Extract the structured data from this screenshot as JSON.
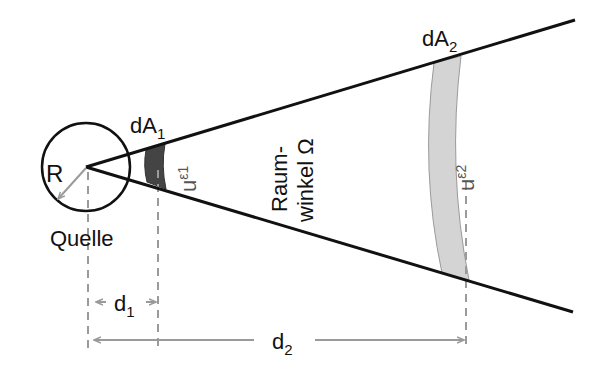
{
  "diagram": {
    "type": "solid-angle-illustration",
    "colors": {
      "line": "#111111",
      "dimension": "#9a9a9a",
      "band_near": "#444444",
      "band_far": "#d4d4d4",
      "band_far_edge": "#9a9a9a",
      "background": "#ffffff"
    },
    "labels": {
      "source_radius": "R",
      "source_name": "Quelle",
      "area_near": {
        "base": "dA",
        "sub": "1"
      },
      "area_far": {
        "base": "dA",
        "sub": "2"
      },
      "energy_near": {
        "base": "u",
        "sub": "ε1"
      },
      "energy_far": {
        "base": "u",
        "sub": "ε2"
      },
      "solid_angle_line1": "Raum-",
      "solid_angle_line2": "winkel Ω",
      "distance_near": {
        "base": "d",
        "sub": "1"
      },
      "distance_far": {
        "base": "d",
        "sub": "2"
      }
    }
  }
}
